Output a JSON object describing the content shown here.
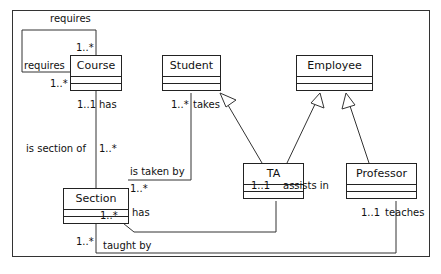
{
  "classes": {
    "course": {
      "name": "Course"
    },
    "student": {
      "name": "Student"
    },
    "employee": {
      "name": "Employee"
    },
    "ta": {
      "name": "TA"
    },
    "professor": {
      "name": "Professor"
    },
    "section": {
      "name": "Section"
    }
  },
  "associations": {
    "course_requires": {
      "top_label": "requires",
      "left_label": "requires",
      "mult_top": "1..*",
      "mult_left": "1..*"
    },
    "course_section": {
      "role_course": "has",
      "mult_course": "1..1",
      "role_section": "is section of",
      "mult_section": "1..*"
    },
    "student_section": {
      "role_student": "takes",
      "mult_student": "1..*",
      "role_section": "is taken by",
      "mult_section": "1..*"
    },
    "ta_section": {
      "role_ta": "assists in",
      "mult_ta": "1..1",
      "role_section": "has",
      "mult_section": "1..*"
    },
    "professor_section": {
      "role_professor": "teaches",
      "mult_professor": "1..1",
      "role_section": "taught by",
      "mult_section": "1..*"
    }
  },
  "generalizations": [
    {
      "child": "TA",
      "parent": "Student"
    },
    {
      "child": "TA",
      "parent": "Employee"
    },
    {
      "child": "Professor",
      "parent": "Employee"
    }
  ]
}
